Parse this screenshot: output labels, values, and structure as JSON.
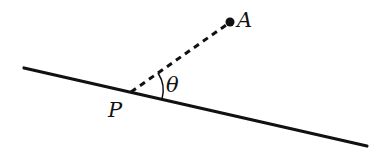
{
  "diagram": {
    "labels": {
      "point_a": "A",
      "point_p": "P",
      "angle": "θ"
    },
    "colors": {
      "stroke": "#111111",
      "background": "#ffffff"
    }
  }
}
